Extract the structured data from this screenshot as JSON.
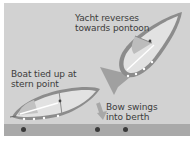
{
  "diagram": {
    "labels": {
      "yacht_reverses": "Yacht reverses\ntowards pontoon",
      "boat_tied": "Boat tied up at\nstern point",
      "bow_swings": "Bow swings\ninto berth"
    },
    "colors": {
      "background": "#d2d2d2",
      "pontoon": "#a9a9a9",
      "hull_outline": "#8a8a8a",
      "deck": "#e4e4e4",
      "arrow": "#9a9a9a",
      "text": "#3c3c3c",
      "post": "#3a3a3a"
    },
    "elements": [
      "yacht-reversing",
      "large-arrow",
      "yacht-moored",
      "small-arrow",
      "pontoon",
      "mooring-posts"
    ],
    "posts_count": 3
  }
}
